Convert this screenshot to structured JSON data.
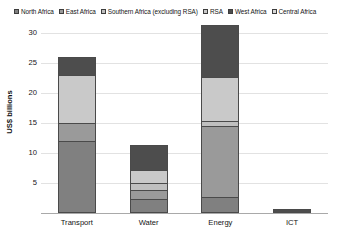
{
  "chart_data": {
    "type": "bar",
    "subtype": "stacked-vertical",
    "title": "",
    "xlabel": "",
    "ylabel": "US$ billions",
    "ylim": [
      0,
      32
    ],
    "yticks": [
      0,
      5,
      10,
      15,
      20,
      25,
      30
    ],
    "ytick_labels": [
      "0",
      "5",
      "10",
      "15",
      "20",
      "25",
      "30"
    ],
    "grid": true,
    "legend_position": "top",
    "categories": [
      "Transport",
      "Water",
      "Energy",
      "ICT"
    ],
    "series": [
      {
        "name": "North Africa",
        "color": "#808080",
        "values": [
          12.0,
          2.3,
          2.7,
          0.0
        ]
      },
      {
        "name": "East Africa",
        "color": "#9a9a9a",
        "values": [
          3.0,
          1.6,
          11.8,
          0.0
        ]
      },
      {
        "name": "Southern Africa (excluding RSA)",
        "color": "#bfbfbf",
        "values": [
          0.0,
          1.1,
          0.9,
          0.0
        ]
      },
      {
        "name": "RSA",
        "color": "#c9c9c9",
        "values": [
          8.0,
          2.2,
          7.3,
          0.0
        ]
      },
      {
        "name": "West Africa",
        "color": "#4d4d4d",
        "values": [
          3.0,
          4.2,
          8.6,
          0.7
        ]
      },
      {
        "name": "Central Africa",
        "color": "#d9d9d9",
        "values": [
          0.0,
          0.0,
          0.0,
          0.0
        ]
      }
    ],
    "totals": [
      26.0,
      11.4,
      31.3,
      0.7
    ]
  }
}
